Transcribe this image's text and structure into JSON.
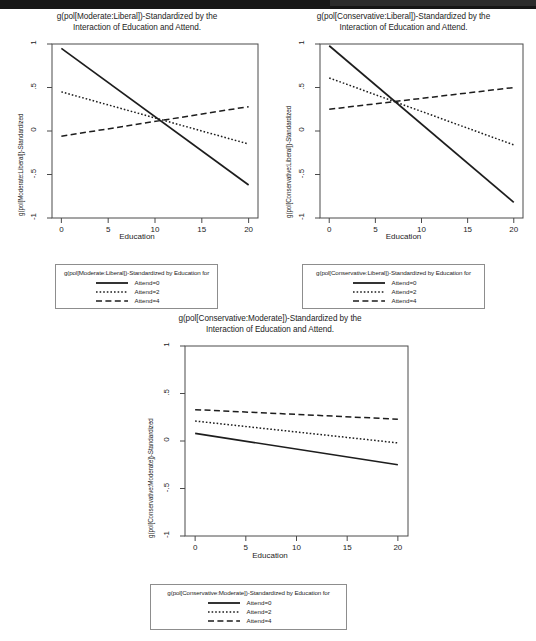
{
  "page": {
    "background": "#ffffff",
    "scan_bar_color": "#171717"
  },
  "charts": [
    {
      "id": "moderate-liberal",
      "title": "g(pol[Moderate:Liberal])-Standardized by the\nInteraction of Education and Attend.",
      "xlabel": "Education",
      "ylabel": "g(pol[Moderate:Liberal])-Standardized",
      "xticks": [
        "0",
        "5",
        "10",
        "15",
        "20"
      ],
      "yticks": [
        "1",
        ".5",
        "0",
        "-.5",
        "-1"
      ],
      "legend": {
        "title": "g(pol[Moderate:Liberal])-Standardized by Education for",
        "entries": [
          {
            "label": "Attend=0",
            "style": "solid"
          },
          {
            "label": "Attend=2",
            "style": "dotted"
          },
          {
            "label": "Attend=4",
            "style": "dashed"
          }
        ]
      }
    },
    {
      "id": "conservative-liberal",
      "title": "g(pol[Conservative:Liberal])-Standardized by the\nInteraction of Education and Attend.",
      "xlabel": "Education",
      "ylabel": "g(pol[Conservative:Liberal])-Standardized",
      "xticks": [
        "0",
        "5",
        "10",
        "15",
        "20"
      ],
      "yticks": [
        "1",
        ".5",
        "0",
        "-.5",
        "-1"
      ],
      "legend": {
        "title": "g(pol[Conservative:Liberal])-Standardized by Education for",
        "entries": [
          {
            "label": "Attend=0",
            "style": "solid"
          },
          {
            "label": "Attend=2",
            "style": "dotted"
          },
          {
            "label": "Attend=4",
            "style": "dashed"
          }
        ]
      }
    },
    {
      "id": "conservative-moderate",
      "title": "g(pol[Conservative:Moderate])-Standardized by the\nInteraction of Education and Attend.",
      "xlabel": "Education",
      "ylabel": "g(pol[Conservative:Moderate])-Standardized",
      "xticks": [
        "0",
        "5",
        "10",
        "15",
        "20"
      ],
      "yticks": [
        "1",
        ".5",
        "0",
        "-.5",
        "-1"
      ],
      "legend": {
        "title": "g(pol[Conservative:Moderate])-Standardized by Education for",
        "entries": [
          {
            "label": "Attend=0",
            "style": "solid"
          },
          {
            "label": "Attend=2",
            "style": "dotted"
          },
          {
            "label": "Attend=4",
            "style": "dashed"
          }
        ]
      }
    }
  ],
  "chart_data": [
    {
      "type": "line",
      "title": "g(pol[Moderate:Liberal])-Standardized by the Interaction of Education and Attend.",
      "xlabel": "Education",
      "ylabel": "g(pol[Moderate:Liberal])-Standardized",
      "xlim": [
        -1,
        21
      ],
      "ylim": [
        -1,
        1
      ],
      "xticks": [
        0,
        5,
        10,
        15,
        20
      ],
      "yticks": [
        -1,
        -0.5,
        0,
        0.5,
        1
      ],
      "ytick_labels": [
        "-1",
        "-.5",
        "0",
        ".5",
        "1"
      ],
      "grid": false,
      "legend_position": "below-outside",
      "x": [
        0,
        20
      ],
      "series": [
        {
          "name": "Attend=0",
          "style": "solid",
          "values": [
            0.95,
            -0.62
          ]
        },
        {
          "name": "Attend=2",
          "style": "dotted",
          "values": [
            0.45,
            -0.15
          ]
        },
        {
          "name": "Attend=4",
          "style": "dashed",
          "values": [
            -0.06,
            0.28
          ]
        }
      ]
    },
    {
      "type": "line",
      "title": "g(pol[Conservative:Liberal])-Standardized by the Interaction of Education and Attend.",
      "xlabel": "Education",
      "ylabel": "g(pol[Conservative:Liberal])-Standardized",
      "xlim": [
        -1,
        21
      ],
      "ylim": [
        -1,
        1
      ],
      "xticks": [
        0,
        5,
        10,
        15,
        20
      ],
      "yticks": [
        -1,
        -0.5,
        0,
        0.5,
        1
      ],
      "ytick_labels": [
        "-1",
        "-.5",
        "0",
        ".5",
        "1"
      ],
      "grid": false,
      "legend_position": "below-outside",
      "x": [
        0,
        20
      ],
      "series": [
        {
          "name": "Attend=0",
          "style": "solid",
          "values": [
            0.98,
            -0.82
          ]
        },
        {
          "name": "Attend=2",
          "style": "dotted",
          "values": [
            0.61,
            -0.16
          ]
        },
        {
          "name": "Attend=4",
          "style": "dashed",
          "values": [
            0.25,
            0.5
          ]
        }
      ]
    },
    {
      "type": "line",
      "title": "g(pol[Conservative:Moderate])-Standardized by the Interaction of Education and Attend.",
      "xlabel": "Education",
      "ylabel": "g(pol[Conservative:Moderate])-Standardized",
      "xlim": [
        -1,
        21
      ],
      "ylim": [
        -1,
        1
      ],
      "xticks": [
        0,
        5,
        10,
        15,
        20
      ],
      "yticks": [
        -1,
        -0.5,
        0,
        0.5,
        1
      ],
      "ytick_labels": [
        "-1",
        "-.5",
        "0",
        ".5",
        "1"
      ],
      "grid": false,
      "legend_position": "below-outside",
      "x": [
        0,
        20
      ],
      "series": [
        {
          "name": "Attend=0",
          "style": "solid",
          "values": [
            0.08,
            -0.25
          ]
        },
        {
          "name": "Attend=2",
          "style": "dotted",
          "values": [
            0.21,
            -0.02
          ]
        },
        {
          "name": "Attend=4",
          "style": "dashed",
          "values": [
            0.33,
            0.23
          ]
        }
      ]
    }
  ]
}
